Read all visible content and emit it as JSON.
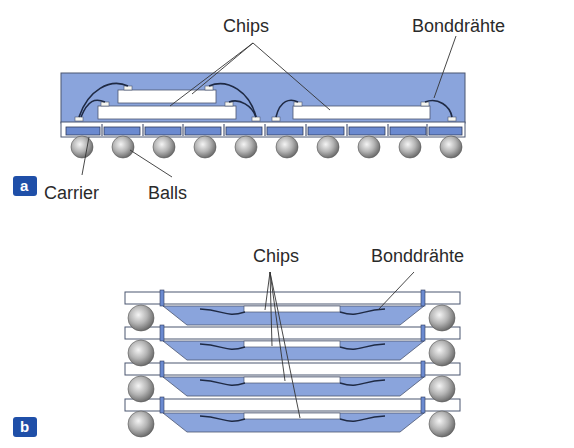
{
  "colors": {
    "mold": "#8aa4dc",
    "mold_stroke": "#4b5670",
    "chip": "#ffffff",
    "carrier": "#ffffff",
    "pad": "#6b8ad0",
    "wire": "#1f2a44",
    "ball": "#b8b8b8",
    "badge": "#1f4fa8",
    "text": "#2a2a2a",
    "leader": "#333333"
  },
  "figure_a": {
    "badge": "a",
    "labels": {
      "chips": "Chips",
      "bonddraehte": "Bonddrähte",
      "carrier": "Carrier",
      "balls": "Balls"
    },
    "ball_count": 10
  },
  "figure_b": {
    "badge": "b",
    "labels": {
      "chips": "Chips",
      "bonddraehte": "Bonddrähte"
    },
    "stack_levels": 4
  }
}
